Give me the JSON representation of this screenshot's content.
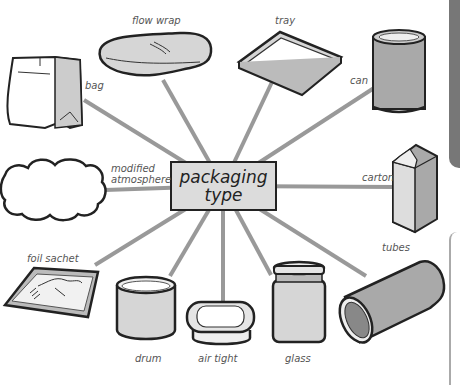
{
  "diagram": {
    "center": {
      "line1": "packaging",
      "line2": "type"
    },
    "items": [
      {
        "id": "flow-wrap",
        "label": "flow wrap"
      },
      {
        "id": "tray",
        "label": "tray"
      },
      {
        "id": "bag",
        "label": "bag"
      },
      {
        "id": "can",
        "label": "can"
      },
      {
        "id": "modified-atmosphere",
        "label_line1": "modified",
        "label_line2": "atmosphere"
      },
      {
        "id": "carton",
        "label": "carton"
      },
      {
        "id": "foil-sachet",
        "label": "foil sachet"
      },
      {
        "id": "tubes",
        "label": "tubes"
      },
      {
        "id": "drum",
        "label": "drum"
      },
      {
        "id": "air-tight",
        "label": "air tight"
      },
      {
        "id": "glass",
        "label": "glass"
      }
    ],
    "colors": {
      "connector": "#999999",
      "center_fill": "#dcdcdc",
      "outline": "#222222",
      "fill_gray": "#a9a9a9",
      "fill_light": "#d6d6d6"
    }
  }
}
